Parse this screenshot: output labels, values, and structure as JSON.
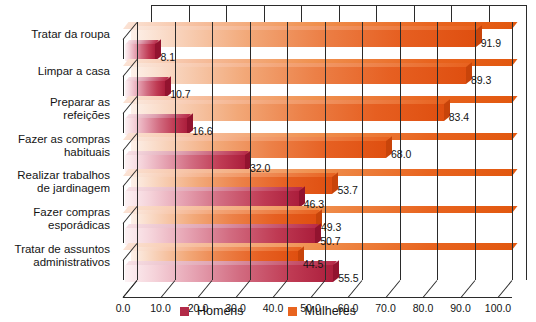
{
  "chart_data": {
    "type": "bar",
    "orientation": "horizontal",
    "title": "",
    "xlabel": "",
    "ylabel": "",
    "xlim": [
      0,
      100
    ],
    "xtick_step": 10,
    "grid": true,
    "legend_position": "bottom-center",
    "categories": [
      "Tratar da roupa",
      "Limpar a casa",
      "Preparar as\nrefeições",
      "Fazer as compras\nhabituais",
      "Realizar trabalhos\nde jardinagem",
      "Fazer compras\nesporádicas",
      "Tratar de assuntos\nadministrativos"
    ],
    "tick_labels": [
      "0.0",
      "10.0",
      "20.0",
      "30.0",
      "40.0",
      "50.0",
      "60.0",
      "70.0",
      "80.0",
      "90.0",
      "100.0"
    ],
    "series": [
      {
        "name": "Mulheres",
        "color": "#e8641f",
        "values": [
          91.9,
          89.3,
          83.4,
          68.0,
          53.7,
          49.3,
          44.5
        ],
        "value_labels": [
          "91.9",
          "89.3",
          "83.4",
          "68.0",
          "53.7",
          "49.3",
          "44.5"
        ]
      },
      {
        "name": "Homens",
        "color": "#b22a48",
        "values": [
          8.1,
          10.7,
          16.6,
          32.0,
          46.3,
          50.7,
          55.5
        ],
        "value_labels": [
          "8.1",
          "10.7",
          "16.6",
          "32.0",
          "46.3",
          "50.7",
          "55.5"
        ]
      }
    ],
    "legend": [
      {
        "label": "Homens",
        "color": "#b22a48"
      },
      {
        "label": "Mulheres",
        "color": "#e8641f"
      }
    ]
  }
}
